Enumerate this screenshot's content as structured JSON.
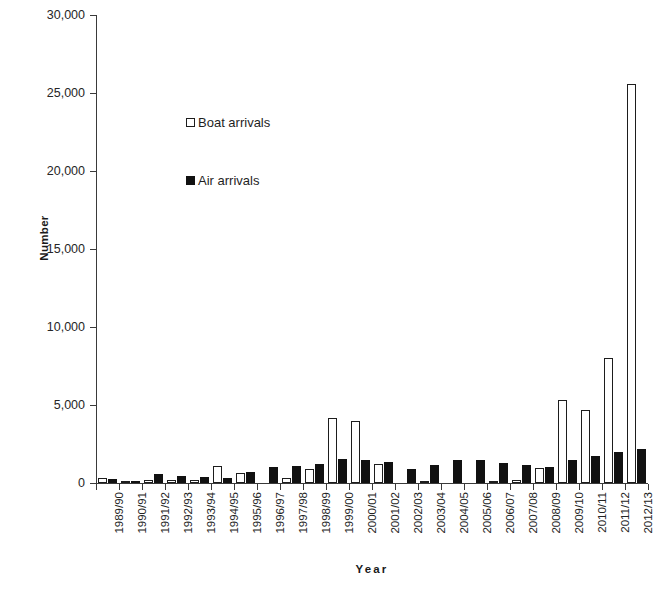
{
  "chart_data": {
    "type": "bar",
    "title": "",
    "xlabel": "Year",
    "ylabel": "Number",
    "ylim": [
      0,
      30000
    ],
    "ytick_step": 5000,
    "ytick_labels": [
      "0",
      "5,000",
      "10,000",
      "15,000",
      "20,000",
      "25,000",
      "30,000"
    ],
    "ytick_values": [
      0,
      5000,
      10000,
      15000,
      20000,
      25000,
      30000
    ],
    "grid": false,
    "legend_position": "upper-left-inside",
    "categories": [
      "1989/90",
      "1990/91",
      "1991/92",
      "1992/93",
      "1993/94",
      "1994/95",
      "1995/96",
      "1996/97",
      "1997/98",
      "1998/99",
      "1999/00",
      "2000/01",
      "2001/02",
      "2002/03",
      "2003/04",
      "2004/05",
      "2005/06",
      "2006/07",
      "2007/08",
      "2008/09",
      "2009/10",
      "2010/11",
      "2011/12",
      "2012/13"
    ],
    "series": [
      {
        "name": "Boat arrivals",
        "color": "#ffffff",
        "edge_color": "#1d1d1d",
        "values": [
          300,
          120,
          220,
          220,
          190,
          1070,
          620,
          0,
          340,
          930,
          4175,
          4005,
          1210,
          0,
          90,
          0,
          0,
          60,
          170,
          990,
          5320,
          4660,
          8000,
          25600
        ]
      },
      {
        "name": "Air arrivals",
        "color": "#111111",
        "edge_color": "#111111",
        "values": [
          250,
          160,
          600,
          420,
          380,
          350,
          680,
          1040,
          1120,
          1190,
          1570,
          1500,
          1340,
          900,
          1180,
          1500,
          1470,
          1300,
          1170,
          1000,
          1450,
          1740,
          2010,
          2180
        ]
      }
    ]
  },
  "legend": {
    "items": [
      {
        "label": "Boat arrivals",
        "marker": "hollow-square-icon"
      },
      {
        "label": "Air arrivals",
        "marker": "filled-square-icon"
      }
    ]
  },
  "axis_titles": {
    "y": "Number",
    "x": "Year"
  }
}
